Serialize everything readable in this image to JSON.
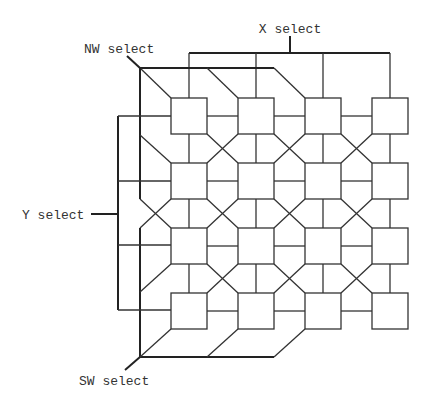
{
  "labels": {
    "x_select": "X select",
    "y_select": "Y select",
    "nw_select": "NW select",
    "sw_select": "SW select"
  },
  "grid": {
    "rows": 4,
    "cols": 4,
    "col_x": [
      171,
      238,
      305,
      372
    ],
    "row_y": [
      98,
      163,
      228,
      293
    ],
    "cell_size": 36
  },
  "colors": {
    "line": "#333333",
    "background": "#ffffff"
  }
}
